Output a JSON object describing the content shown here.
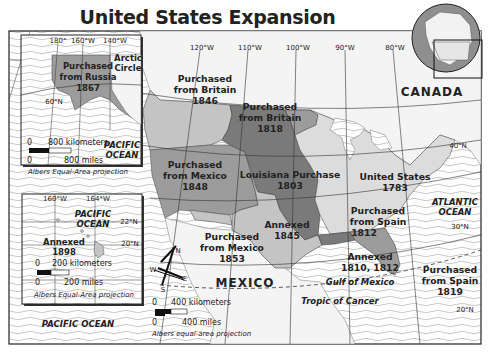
{
  "title": "United States Expansion",
  "regions": {
    "alaska": {
      "line1": "Purchased",
      "line2": "from Russia",
      "year": "1867"
    },
    "oregon": {
      "line1": "Purchased",
      "line2": "from Britain",
      "year": "1846"
    },
    "red_river": {
      "line1": "Purchased",
      "line2": "from Britain",
      "year": "1818"
    },
    "mexican_cession": {
      "line1": "Purchased",
      "line2": "from Mexico",
      "year": "1848"
    },
    "louisiana": {
      "line1": "Louisiana Purchase",
      "year": "1803"
    },
    "texas": {
      "line1": "Annexed",
      "year": "1845"
    },
    "original": {
      "line1": "United States",
      "year": "1783"
    },
    "gadsden": {
      "line1": "Purchased",
      "line2": "from Mexico",
      "year": "1853"
    },
    "east_florida_1812": {
      "line1": "Purchased",
      "line2": "from Spain",
      "year": "1812"
    },
    "west_florida": {
      "line1": "Annexed",
      "year": "1810, 1812"
    },
    "florida": {
      "line1": "Purchased",
      "line2": "from Spain",
      "year": "1819"
    },
    "hawaii": {
      "line1": "Annexed",
      "year": "1898"
    }
  },
  "places": {
    "canada": "CANADA",
    "mexico": "MEXICO",
    "atlantic_1": "ATLANTIC",
    "atlantic_2": "OCEAN",
    "gulf": "Gulf of Mexico",
    "tropic": "Tropic of Cancer",
    "pacific_main": "PACIFIC OCEAN",
    "pacific_ak_1": "PACIFIC",
    "pacific_ak_2": "OCEAN",
    "pacific_hi_1": "PACIFIC",
    "pacific_hi_2": "OCEAN",
    "arctic_1": "Arctic",
    "arctic_2": "Circle"
  },
  "longitudes": [
    "120°W",
    "110°W",
    "100°W",
    "90°W",
    "80°W"
  ],
  "latitudes": [
    "40°N",
    "30°N",
    "20°N"
  ],
  "alaska_inset": {
    "longitudes": [
      "180°",
      "160°W",
      "140°W"
    ],
    "latitude": "60°N",
    "scale_km": "800 kilometers",
    "scale_mi": "800 miles",
    "zero": "0",
    "projection": "Albers Equal-Area projection"
  },
  "hawaii_inset": {
    "longitudes": [
      "160°W",
      "164°W"
    ],
    "latitudes": [
      "22°N",
      "20°N"
    ],
    "scale_km": "200 kilometers",
    "scale_mi": "200 miles",
    "zero": "0",
    "projection": "Albers Equal-Area projection"
  },
  "main_scale": {
    "scale_km": "400 kilometers",
    "scale_mi": "400 miles",
    "zero": "0",
    "projection": "Albers equal-area projection"
  },
  "compass": {
    "n": "N",
    "s": "S",
    "e": "E",
    "w": "W"
  },
  "colors": {
    "dark": "#7a7a7a",
    "medium": "#9c9c9c",
    "light": "#c4c4c4",
    "pale": "#dcdcdc",
    "land_foreign": "#f4f4f4",
    "water_line": "#b8b8b8"
  }
}
